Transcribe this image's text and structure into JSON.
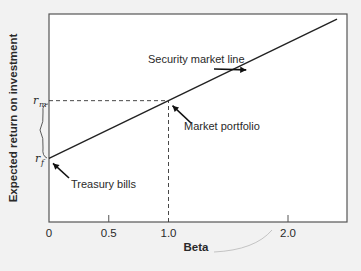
{
  "chart_data": {
    "type": "line",
    "title": "",
    "xlabel": "Beta",
    "ylabel": "Expected return on investment",
    "xlim": [
      0,
      2.5
    ],
    "ylim": [
      0,
      3.6
    ],
    "x_ticks": [
      {
        "value": 0,
        "label": "0"
      },
      {
        "value": 0.5,
        "label": "0.5"
      },
      {
        "value": 1.0,
        "label": "1.0"
      },
      {
        "value": 2.0,
        "label": "2.0"
      }
    ],
    "y_markers": [
      {
        "name": "rm",
        "symbol": "r",
        "subscript": "m",
        "value": 2.1
      },
      {
        "name": "rf",
        "symbol": "r",
        "subscript": "f",
        "value": 1.1
      }
    ],
    "series": [
      {
        "name": "Security market line",
        "x": [
          0,
          2.41
        ],
        "y": [
          1.1,
          3.51
        ]
      }
    ],
    "reference_lines": [
      {
        "name": "market-return-guide",
        "from": [
          0,
          2.1
        ],
        "to": [
          1.0,
          2.1
        ],
        "style": "dashed"
      },
      {
        "name": "market-beta-guide",
        "from": [
          1.0,
          0
        ],
        "to": [
          1.0,
          2.1
        ],
        "style": "dashed"
      }
    ],
    "annotations": [
      {
        "text": "Security market line",
        "points_to": [
          1.55,
          2.65
        ]
      },
      {
        "text": "Market portfolio",
        "points_to": [
          1.0,
          2.1
        ]
      },
      {
        "text": "Treasury bills",
        "points_to": [
          0,
          1.1
        ]
      }
    ],
    "grid": false,
    "legend": "none",
    "colors": {
      "background": "#f2f2f2",
      "plot_area": "#ffffff",
      "line": "#222222",
      "frame": "#555555"
    }
  }
}
